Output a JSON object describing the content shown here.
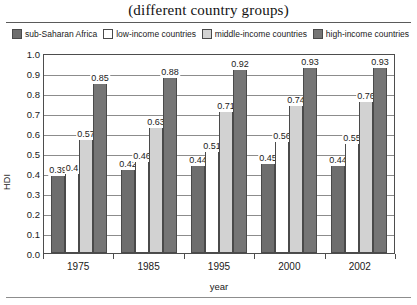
{
  "title": "(different country groups)",
  "legend": {
    "position": "top",
    "items": [
      {
        "label": "sub-Saharan Africa",
        "color": "#6e6e6e",
        "swatch_name": "legend-swatch-sub-saharan-africa"
      },
      {
        "label": "low-income countries",
        "color": "#ffffff",
        "swatch_name": "legend-swatch-low-income"
      },
      {
        "label": "middle-income countries",
        "color": "#d2d2d2",
        "swatch_name": "legend-swatch-middle-income"
      },
      {
        "label": "high-income countries",
        "color": "#757575",
        "swatch_name": "legend-swatch-high-income"
      }
    ]
  },
  "axes": {
    "ylabel": "HDI",
    "xlabel": "year",
    "yticks": [
      "1.0",
      "0.9",
      "0.8",
      "0.7",
      "0.6",
      "0.5",
      "0.4",
      "0.3",
      "0.2",
      "0.1",
      "0.0"
    ],
    "xticks": [
      "1975",
      "1985",
      "1995",
      "2000",
      "2002"
    ]
  },
  "chart_data": {
    "type": "bar",
    "title": "(different country groups)",
    "xlabel": "year",
    "ylabel": "HDI",
    "ylim": [
      0.0,
      1.0
    ],
    "ytick_step": 0.1,
    "grid": true,
    "legend_position": "top",
    "categories": [
      "1975",
      "1985",
      "1995",
      "2000",
      "2002"
    ],
    "series": [
      {
        "name": "sub-Saharan Africa",
        "color": "#6e6e6e",
        "values": [
          0.39,
          0.42,
          0.44,
          0.45,
          0.44
        ],
        "labels": [
          "0.39",
          "0.42",
          "0.44",
          "0.45",
          "0.44"
        ]
      },
      {
        "name": "low-income countries",
        "color": "#ffffff",
        "values": [
          0.4,
          0.46,
          0.51,
          0.56,
          0.55
        ],
        "labels": [
          "0.4",
          "0.46",
          "0.51",
          "0.56",
          "0.55"
        ]
      },
      {
        "name": "middle-income countries",
        "color": "#d2d2d2",
        "values": [
          0.57,
          0.63,
          0.71,
          0.74,
          0.76
        ],
        "labels": [
          "0.57",
          "0.63",
          "0.71",
          "0.74",
          "0.76"
        ]
      },
      {
        "name": "high-income countries",
        "color": "#757575",
        "values": [
          0.85,
          0.88,
          0.92,
          0.93,
          0.93
        ],
        "labels": [
          "0.85",
          "0.88",
          "0.92",
          "0.93",
          "0.93"
        ]
      }
    ]
  }
}
